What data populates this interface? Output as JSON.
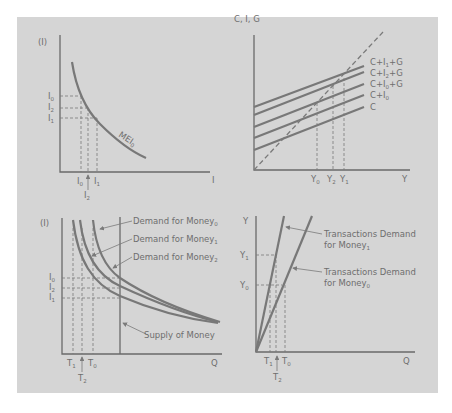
{
  "colors": {
    "page_background": "#ffffff",
    "panel_background": "#d5d5d5",
    "ink": "#6e6e6e"
  },
  "panels": {
    "top_left": {
      "title": "Investment demand (MEI)",
      "y_axis_label": "(I)",
      "x_axis_label": "I",
      "curve_label": "MEI",
      "curve_label_sub": "0",
      "y_ticks": [
        {
          "main": "I",
          "sub": "0"
        },
        {
          "main": "I",
          "sub": "2"
        },
        {
          "main": "I",
          "sub": "1"
        }
      ],
      "x_ticks": [
        {
          "main": "I",
          "sub": "0"
        },
        {
          "main": "I",
          "sub": "1"
        },
        {
          "main": "I",
          "sub": "2"
        }
      ]
    },
    "top_right": {
      "title": "Aggregate expenditure (Keynesian cross)",
      "y_axis_label": "C, I, G",
      "x_axis_label": "Y",
      "lines": [
        {
          "main": "C+I",
          "sub": "1",
          "tail": "+G"
        },
        {
          "main": "C+I",
          "sub": "2",
          "tail": "+G"
        },
        {
          "main": "C+I",
          "sub": "0",
          "tail": "+G"
        },
        {
          "main": "C+I",
          "sub": "0",
          "tail": ""
        },
        {
          "main": "C",
          "sub": "",
          "tail": ""
        }
      ],
      "x_ticks": [
        {
          "main": "Y",
          "sub": "0"
        },
        {
          "main": "Y",
          "sub": "2"
        },
        {
          "main": "Y",
          "sub": "1"
        }
      ]
    },
    "bottom_left": {
      "title": "Money market",
      "y_axis_label": "(I)",
      "x_axis_label": "Q",
      "demand_labels": [
        {
          "main": "Demand for Money",
          "sub": "0"
        },
        {
          "main": "Demand for Money",
          "sub": "1"
        },
        {
          "main": "Demand for Money",
          "sub": "2"
        }
      ],
      "supply_label": "Supply of Money",
      "y_ticks": [
        {
          "main": "I",
          "sub": "0"
        },
        {
          "main": "I",
          "sub": "2"
        },
        {
          "main": "I",
          "sub": "1"
        }
      ],
      "x_ticks": [
        {
          "main": "T",
          "sub": "1"
        },
        {
          "main": "T",
          "sub": "0"
        },
        {
          "main": "T",
          "sub": "2"
        }
      ]
    },
    "bottom_right": {
      "title": "Transactions demand for money",
      "y_axis_label": "Y",
      "x_axis_label": "Q",
      "line_labels": [
        {
          "line1": "Transactions Demand",
          "line2": "for Money",
          "sub": "1"
        },
        {
          "line1": "Transactions Demand",
          "line2": "for Money",
          "sub": "0"
        }
      ],
      "y_ticks": [
        {
          "main": "Y",
          "sub": "1"
        },
        {
          "main": "Y",
          "sub": "0"
        }
      ],
      "x_ticks": [
        {
          "main": "T",
          "sub": "1"
        },
        {
          "main": "T",
          "sub": "0"
        },
        {
          "main": "T",
          "sub": "2"
        }
      ]
    }
  }
}
